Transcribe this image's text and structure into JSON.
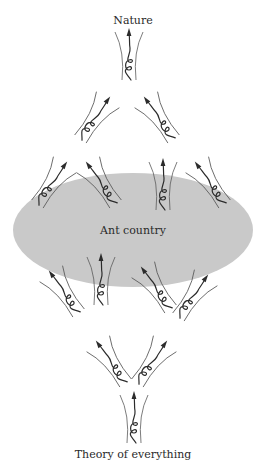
{
  "labels": {
    "top": "Nature",
    "center": "Ant country",
    "bottom": "Theory of everything"
  },
  "colors": {
    "ellipse_fill": "#c9c9c9",
    "stroke": "#2b2b2b",
    "thin_stroke": "#5a5a5a",
    "text": "#2a2a2a",
    "background": "#ffffff"
  },
  "ellipse": {
    "cx": 133,
    "cy": 230,
    "rx": 120,
    "ry": 57
  },
  "glyphs": [
    {
      "id": "top",
      "x": 129,
      "y": 58,
      "angle": 0,
      "scale": 1.0
    },
    {
      "id": "upper-left",
      "x": 93,
      "y": 121,
      "angle": 35,
      "scale": 1.0
    },
    {
      "id": "upper-right",
      "x": 161,
      "y": 121,
      "angle": -35,
      "scale": 1.0
    },
    {
      "id": "mid-1",
      "x": 50,
      "y": 186,
      "angle": 35,
      "scale": 1.0
    },
    {
      "id": "mid-2",
      "x": 103,
      "y": 186,
      "angle": -35,
      "scale": 1.0
    },
    {
      "id": "mid-3",
      "x": 163,
      "y": 188,
      "angle": 0,
      "scale": 1.0
    },
    {
      "id": "mid-4",
      "x": 212,
      "y": 186,
      "angle": -35,
      "scale": 1.0
    },
    {
      "id": "low-1",
      "x": 66,
      "y": 295,
      "angle": -35,
      "scale": 1.0
    },
    {
      "id": "low-2",
      "x": 101,
      "y": 283,
      "angle": 0,
      "scale": 1.0
    },
    {
      "id": "low-3",
      "x": 158,
      "y": 291,
      "angle": -35,
      "scale": 1.0
    },
    {
      "id": "low-4",
      "x": 191,
      "y": 299,
      "angle": 35,
      "scale": 1.0
    },
    {
      "id": "lower-left",
      "x": 113,
      "y": 365,
      "angle": -35,
      "scale": 1.0
    },
    {
      "id": "lower-right",
      "x": 150,
      "y": 365,
      "angle": 35,
      "scale": 1.0
    },
    {
      "id": "bottom",
      "x": 134,
      "y": 421,
      "angle": 0,
      "scale": 1.0
    }
  ]
}
